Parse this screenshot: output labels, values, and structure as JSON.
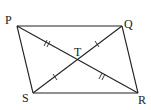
{
  "figure": {
    "type": "parallelogram with diagonals",
    "vertices": {
      "P": {
        "label": "P",
        "x": 17,
        "y": 26
      },
      "Q": {
        "label": "Q",
        "x": 122,
        "y": 26
      },
      "R": {
        "label": "R",
        "x": 138,
        "y": 93
      },
      "S": {
        "label": "S",
        "x": 33,
        "y": 93
      }
    },
    "intersection": {
      "label": "T",
      "x": 78,
      "y": 60
    },
    "sides": [
      "PQ",
      "QR",
      "RS",
      "SP"
    ],
    "diagonals": [
      "PR",
      "QS"
    ],
    "tick_marks": {
      "PT": "double",
      "TR": "double",
      "ST": "single",
      "TQ": "single"
    },
    "colors": {
      "stroke": "#222222",
      "background": "#ffffff"
    }
  }
}
